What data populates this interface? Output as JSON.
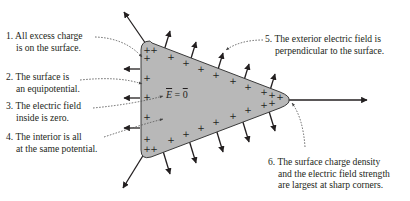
{
  "diagram": {
    "type": "conductor-electrostatic-equilibrium",
    "shape": {
      "fill": "#b8b8b8",
      "stroke": "#3a3a3a",
      "charge_symbol": "+"
    },
    "interior_label": {
      "vector": "E",
      "equals": "=",
      "value": "0",
      "text": "E = 0"
    },
    "annotations": [
      {
        "id": 1,
        "line1": "1. All excess charge",
        "line2": "is on the surface."
      },
      {
        "id": 2,
        "line1": "2. The surface is",
        "line2": "an equipotential."
      },
      {
        "id": 3,
        "line1": "3. The electric field",
        "line2": "inside is zero."
      },
      {
        "id": 4,
        "line1": "4. The interior is all",
        "line2": "at the same potential."
      },
      {
        "id": 5,
        "line1": "5. The exterior electric field is",
        "line2": "perpendicular to the surface."
      },
      {
        "id": 6,
        "line1": "6. The surface charge density",
        "line2": "and the electric field strength",
        "line3": "are largest at sharp corners."
      }
    ],
    "colors": {
      "text": "#231f20",
      "arrow": "#231f20",
      "pointer": "#555555"
    }
  }
}
